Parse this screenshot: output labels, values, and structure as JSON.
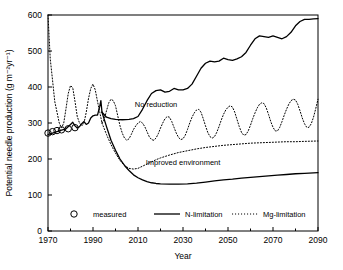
{
  "chart_data": {
    "type": "line",
    "title": "",
    "xlabel": "Year",
    "ylabel": "Potential needle production (g m⁻²yr⁻¹)",
    "xlim": [
      1970,
      2090
    ],
    "ylim": [
      0,
      600
    ],
    "xticks": [
      1970,
      1990,
      2010,
      2030,
      2050,
      2070,
      2090
    ],
    "xticklabels": [
      "1970",
      "1990",
      "2010",
      "2030",
      "2050",
      "2070",
      "2090"
    ],
    "xminorticks": [
      1980,
      2000,
      2020,
      2040,
      2060,
      2080
    ],
    "yticks": [
      0,
      100,
      200,
      300,
      400,
      500,
      600
    ],
    "yticklabels": [
      "0",
      "100",
      "200",
      "300",
      "400",
      "500",
      "600"
    ],
    "grid": false,
    "legend_position": "bottom",
    "annotations": [
      {
        "text": "No reduction",
        "x": 2018,
        "y": 345
      },
      {
        "text": "Improved environment",
        "x": 2030,
        "y": 182
      }
    ],
    "legend": [
      {
        "label": "measured",
        "marker": "open-circle",
        "style": "none"
      },
      {
        "label": "N-limitation",
        "marker": "none",
        "style": "solid"
      },
      {
        "label": "Mg-limitation",
        "marker": "none",
        "style": "dotted"
      }
    ],
    "series": [
      {
        "name": "measured",
        "style": "markers",
        "marker": "open-circle",
        "points": [
          [
            1970,
            272
          ],
          [
            1972,
            276
          ],
          [
            1974,
            279
          ],
          [
            1976,
            281
          ],
          [
            1979,
            284
          ],
          [
            1982,
            287
          ]
        ]
      },
      {
        "name": "N-limitation historical",
        "style": "solid",
        "points": [
          [
            1970,
            268
          ],
          [
            1972,
            272
          ],
          [
            1974,
            276
          ],
          [
            1976,
            280
          ],
          [
            1978,
            284
          ],
          [
            1980,
            296
          ],
          [
            1981,
            302
          ],
          [
            1982,
            292
          ],
          [
            1983,
            286
          ],
          [
            1984,
            290
          ],
          [
            1985,
            298
          ],
          [
            1986,
            304
          ],
          [
            1987,
            296
          ],
          [
            1988,
            300
          ],
          [
            1989,
            314
          ],
          [
            1990,
            320
          ],
          [
            1991,
            322
          ],
          [
            1992,
            322
          ],
          [
            1993,
            346
          ],
          [
            1993.5,
            362
          ],
          [
            1994,
            330
          ]
        ]
      },
      {
        "name": "N-limitation no reduction",
        "style": "solid",
        "points": [
          [
            1994,
            330
          ],
          [
            1996,
            316
          ],
          [
            1998,
            312
          ],
          [
            2000,
            310
          ],
          [
            2003,
            309
          ],
          [
            2006,
            310
          ],
          [
            2008,
            312
          ],
          [
            2010,
            318
          ],
          [
            2012,
            338
          ],
          [
            2014,
            362
          ],
          [
            2016,
            382
          ],
          [
            2018,
            390
          ],
          [
            2020,
            392
          ],
          [
            2022,
            386
          ],
          [
            2024,
            388
          ],
          [
            2026,
            396
          ],
          [
            2028,
            392
          ],
          [
            2030,
            392
          ],
          [
            2032,
            396
          ],
          [
            2034,
            408
          ],
          [
            2036,
            430
          ],
          [
            2038,
            452
          ],
          [
            2040,
            466
          ],
          [
            2042,
            472
          ],
          [
            2044,
            470
          ],
          [
            2046,
            472
          ],
          [
            2048,
            480
          ],
          [
            2050,
            476
          ],
          [
            2052,
            474
          ],
          [
            2054,
            478
          ],
          [
            2056,
            484
          ],
          [
            2058,
            496
          ],
          [
            2060,
            516
          ],
          [
            2062,
            534
          ],
          [
            2064,
            542
          ],
          [
            2066,
            540
          ],
          [
            2068,
            538
          ],
          [
            2070,
            542
          ],
          [
            2072,
            538
          ],
          [
            2074,
            534
          ],
          [
            2076,
            540
          ],
          [
            2078,
            552
          ],
          [
            2080,
            570
          ],
          [
            2082,
            582
          ],
          [
            2084,
            588
          ],
          [
            2086,
            588
          ],
          [
            2088,
            589
          ],
          [
            2090,
            590
          ]
        ]
      },
      {
        "name": "N-limitation improved environment",
        "style": "solid",
        "points": [
          [
            1994,
            330
          ],
          [
            1996,
            290
          ],
          [
            1998,
            252
          ],
          [
            2000,
            224
          ],
          [
            2002,
            200
          ],
          [
            2004,
            182
          ],
          [
            2006,
            168
          ],
          [
            2008,
            156
          ],
          [
            2010,
            148
          ],
          [
            2012,
            142
          ],
          [
            2014,
            137
          ],
          [
            2016,
            134
          ],
          [
            2018,
            132
          ],
          [
            2020,
            131
          ],
          [
            2024,
            130
          ],
          [
            2028,
            130
          ],
          [
            2032,
            131
          ],
          [
            2036,
            133
          ],
          [
            2040,
            136
          ],
          [
            2044,
            139
          ],
          [
            2048,
            142
          ],
          [
            2052,
            144
          ],
          [
            2056,
            147
          ],
          [
            2060,
            149
          ],
          [
            2064,
            151
          ],
          [
            2068,
            153
          ],
          [
            2072,
            155
          ],
          [
            2076,
            157
          ],
          [
            2080,
            159
          ],
          [
            2084,
            160
          ],
          [
            2090,
            162
          ]
        ]
      },
      {
        "name": "Mg-limitation historical",
        "style": "dotted",
        "points": [
          [
            1970,
            600
          ],
          [
            1970.5,
            540
          ],
          [
            1971,
            478
          ],
          [
            1972,
            420
          ],
          [
            1973,
            360
          ],
          [
            1974,
            330
          ],
          [
            1975,
            300
          ],
          [
            1976,
            286
          ],
          [
            1977,
            300
          ],
          [
            1978,
            340
          ],
          [
            1979,
            382
          ],
          [
            1980,
            404
          ],
          [
            1981,
            398
          ],
          [
            1982,
            360
          ],
          [
            1983,
            318
          ],
          [
            1984,
            300
          ],
          [
            1985,
            292
          ],
          [
            1986,
            300
          ],
          [
            1987,
            330
          ],
          [
            1988,
            368
          ],
          [
            1989,
            396
          ],
          [
            1990,
            408
          ],
          [
            1991,
            392
          ],
          [
            1992,
            360
          ],
          [
            1993,
            330
          ],
          [
            1994,
            300
          ]
        ]
      },
      {
        "name": "Mg-limitation no reduction",
        "style": "dotted",
        "points": [
          [
            1994,
            300
          ],
          [
            1995,
            310
          ],
          [
            1996,
            334
          ],
          [
            1997,
            356
          ],
          [
            1998,
            366
          ],
          [
            1999,
            362
          ],
          [
            2000,
            348
          ],
          [
            2001,
            320
          ],
          [
            2002,
            292
          ],
          [
            2003,
            272
          ],
          [
            2004,
            258
          ],
          [
            2005,
            252
          ],
          [
            2006,
            256
          ],
          [
            2007,
            268
          ],
          [
            2008,
            282
          ],
          [
            2009,
            292
          ],
          [
            2010,
            300
          ],
          [
            2011,
            304
          ],
          [
            2012,
            300
          ],
          [
            2013,
            290
          ],
          [
            2014,
            276
          ],
          [
            2015,
            262
          ],
          [
            2016,
            254
          ],
          [
            2017,
            252
          ],
          [
            2018,
            258
          ],
          [
            2019,
            270
          ],
          [
            2020,
            286
          ],
          [
            2021,
            300
          ],
          [
            2022,
            312
          ],
          [
            2023,
            318
          ],
          [
            2024,
            316
          ],
          [
            2025,
            304
          ],
          [
            2026,
            288
          ],
          [
            2027,
            272
          ],
          [
            2028,
            260
          ],
          [
            2029,
            254
          ],
          [
            2030,
            256
          ],
          [
            2031,
            266
          ],
          [
            2032,
            282
          ],
          [
            2033,
            300
          ],
          [
            2034,
            316
          ],
          [
            2035,
            328
          ],
          [
            2036,
            336
          ],
          [
            2037,
            338
          ],
          [
            2038,
            330
          ],
          [
            2039,
            312
          ],
          [
            2040,
            292
          ],
          [
            2041,
            274
          ],
          [
            2042,
            262
          ],
          [
            2043,
            258
          ],
          [
            2044,
            262
          ],
          [
            2045,
            274
          ],
          [
            2046,
            290
          ],
          [
            2047,
            308
          ],
          [
            2048,
            324
          ],
          [
            2049,
            336
          ],
          [
            2050,
            344
          ],
          [
            2051,
            348
          ],
          [
            2052,
            344
          ],
          [
            2053,
            330
          ],
          [
            2054,
            310
          ],
          [
            2055,
            290
          ],
          [
            2056,
            274
          ],
          [
            2057,
            266
          ],
          [
            2058,
            268
          ],
          [
            2059,
            278
          ],
          [
            2060,
            294
          ],
          [
            2061,
            312
          ],
          [
            2062,
            328
          ],
          [
            2063,
            342
          ],
          [
            2064,
            352
          ],
          [
            2065,
            356
          ],
          [
            2066,
            354
          ],
          [
            2067,
            342
          ],
          [
            2068,
            324
          ],
          [
            2069,
            304
          ],
          [
            2070,
            288
          ],
          [
            2071,
            278
          ],
          [
            2072,
            278
          ],
          [
            2073,
            288
          ],
          [
            2074,
            304
          ],
          [
            2075,
            322
          ],
          [
            2076,
            338
          ],
          [
            2077,
            352
          ],
          [
            2078,
            362
          ],
          [
            2079,
            366
          ],
          [
            2080,
            364
          ],
          [
            2081,
            352
          ],
          [
            2082,
            334
          ],
          [
            2083,
            314
          ],
          [
            2084,
            298
          ],
          [
            2085,
            288
          ],
          [
            2086,
            288
          ],
          [
            2087,
            298
          ],
          [
            2088,
            316
          ],
          [
            2089,
            340
          ],
          [
            2090,
            366
          ]
        ]
      },
      {
        "name": "Mg-limitation improved environment",
        "style": "dotted",
        "points": [
          [
            1994,
            300
          ],
          [
            1996,
            268
          ],
          [
            1998,
            240
          ],
          [
            2000,
            216
          ],
          [
            2002,
            196
          ],
          [
            2004,
            182
          ],
          [
            2006,
            174
          ],
          [
            2008,
            172
          ],
          [
            2010,
            174
          ],
          [
            2012,
            180
          ],
          [
            2014,
            186
          ],
          [
            2016,
            192
          ],
          [
            2018,
            198
          ],
          [
            2020,
            203
          ],
          [
            2024,
            211
          ],
          [
            2028,
            218
          ],
          [
            2032,
            223
          ],
          [
            2036,
            228
          ],
          [
            2040,
            232
          ],
          [
            2044,
            235
          ],
          [
            2048,
            238
          ],
          [
            2052,
            240
          ],
          [
            2056,
            242
          ],
          [
            2060,
            244
          ],
          [
            2064,
            245
          ],
          [
            2068,
            246
          ],
          [
            2072,
            247
          ],
          [
            2076,
            248
          ],
          [
            2080,
            248
          ],
          [
            2084,
            249
          ],
          [
            2090,
            250
          ]
        ]
      }
    ]
  }
}
